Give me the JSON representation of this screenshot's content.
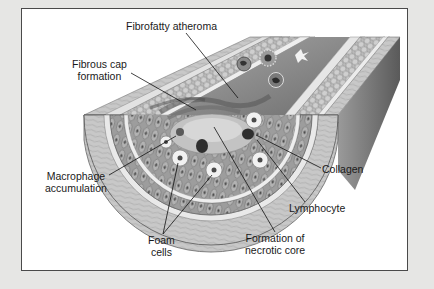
{
  "figure": {
    "labels": {
      "fibrofatty_atheroma": "Fibrofatty atheroma",
      "fibrous_cap": [
        "Fibrous cap",
        "formation"
      ],
      "macrophage": [
        "Macrophage",
        "accumulation"
      ],
      "foam_cells": [
        "Foam",
        "cells"
      ],
      "necrotic_core": [
        "Formation of",
        "necrotic core"
      ],
      "collagen": "Collagen",
      "lymphocyte": "Lymphocyte"
    }
  },
  "colors": {
    "background": "#e6e6e4",
    "frame_fill": "#ffffff",
    "frame_border": "#4a4a4a",
    "label_text": "#1a1a1a"
  }
}
